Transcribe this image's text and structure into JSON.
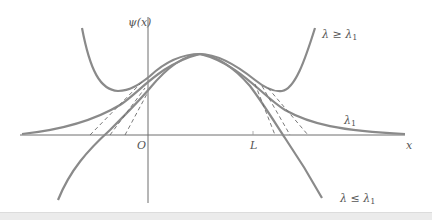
{
  "figure": {
    "type": "diagram",
    "y_axis_label": "ψ(x)",
    "x_axis_label": "x",
    "origin_label": "O",
    "L_label": "L",
    "curves": [
      {
        "id": "lambda-ge",
        "label_main": "λ ≥ λ",
        "label_sub": "1",
        "behavior": "diverges upward at both ends"
      },
      {
        "id": "lambda-eq",
        "label_main": "λ",
        "label_sub": "1",
        "behavior": "decays to zero at both ends"
      },
      {
        "id": "lambda-le",
        "label_main": "λ ≤ λ",
        "label_sub": "1",
        "behavior": "diverges downward at both ends"
      }
    ],
    "colors": {
      "curve": "#8a8a8a",
      "axis": "#6e6e6e",
      "dashed": "#6a6a6a",
      "text": "#555555",
      "strip": "#ebebeb"
    }
  }
}
